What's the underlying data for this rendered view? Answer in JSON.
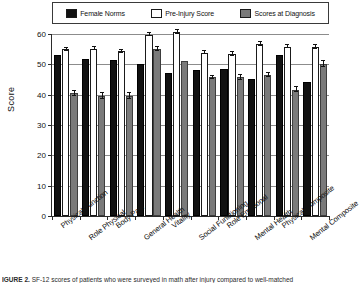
{
  "chart_data": {
    "type": "bar",
    "title": "",
    "xlabel": "",
    "ylabel": "Score",
    "ylim": [
      0,
      60
    ],
    "yticks": [
      0,
      10,
      20,
      30,
      40,
      50,
      60
    ],
    "grid": true,
    "legend_position": "top",
    "categories": [
      "Physical Function",
      "Role Physical",
      "Body Pain",
      "General Health",
      "Vitality",
      "Social Functioning",
      "Role Emotional",
      "Mental Health",
      "Physical Composite",
      "Mental Composite"
    ],
    "series": [
      {
        "name": "Female Norms",
        "color": "#111111",
        "values": [
          53.0,
          51.7,
          51.4,
          50.0,
          47.1,
          48.3,
          48.5,
          45.3,
          53.0,
          44.2
        ],
        "errors": [
          0,
          0,
          0,
          0,
          0,
          0,
          0,
          0,
          0,
          0
        ]
      },
      {
        "name": "Pre-Injury Score",
        "color": "#ffffff",
        "values": [
          55.0,
          55.2,
          54.3,
          59.8,
          60.7,
          53.9,
          53.5,
          56.7,
          55.8,
          55.8
        ],
        "errors": [
          0.5,
          0.4,
          0.5,
          0.4,
          0.7,
          0.5,
          0.6,
          0.7,
          0.5,
          0.6
        ]
      },
      {
        "name": "Scores at Diagnosis",
        "color": "#7a7a7a",
        "values": [
          40.4,
          39.5,
          39.6,
          55.1,
          51.1,
          45.7,
          45.7,
          46.6,
          41.6,
          50.0
        ],
        "errors": [
          0.9,
          1.0,
          1.0,
          0.7,
          0.0,
          0.6,
          0.7,
          0.7,
          0.8,
          1.0
        ]
      }
    ]
  },
  "legend": {
    "items": [
      {
        "label": "Female Norms",
        "swatch": "#111111"
      },
      {
        "label": "Pre-Injury Score",
        "swatch": "#ffffff"
      },
      {
        "label": "Scores at Diagnosis",
        "swatch": "#7a7a7a"
      }
    ]
  },
  "axes": {
    "y_title": "Score",
    "y_tick_labels": [
      "60",
      "50",
      "40",
      "30",
      "20",
      "10",
      "0"
    ]
  },
  "caption": {
    "figure_label": "IGURE 2.",
    "text": "SF-12 scores of patients who were surveyed in math after injury compared to well-matched"
  }
}
